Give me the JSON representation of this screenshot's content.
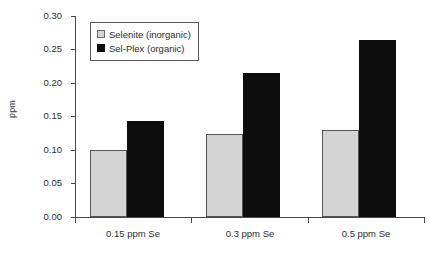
{
  "chart_data": {
    "type": "bar",
    "title": "",
    "xlabel": "",
    "ylabel": "ppm",
    "categories": [
      "0.15 ppm Se",
      "0.3 ppm Se",
      "0.5 ppm Se"
    ],
    "series": [
      {
        "name": "Selenite (inorganic)",
        "color": "#d4d4d4",
        "values": [
          0.1,
          0.124,
          0.13
        ]
      },
      {
        "name": "Sel-Plex (organic)",
        "color": "#0d0d0d",
        "values": [
          0.143,
          0.215,
          0.264
        ]
      }
    ],
    "ylim": [
      0.0,
      0.3
    ],
    "y_ticks": [
      "0.00",
      "0.05",
      "0.10",
      "0.15",
      "0.20",
      "0.25",
      "0.30"
    ],
    "y_tick_values": [
      0.0,
      0.05,
      0.1,
      0.15,
      0.2,
      0.25,
      0.3
    ],
    "grid": false,
    "legend_position": "upper-left"
  },
  "legend": {
    "entries": [
      {
        "label": "Selenite (inorganic)"
      },
      {
        "label": "Sel-Plex (organic)"
      }
    ]
  }
}
